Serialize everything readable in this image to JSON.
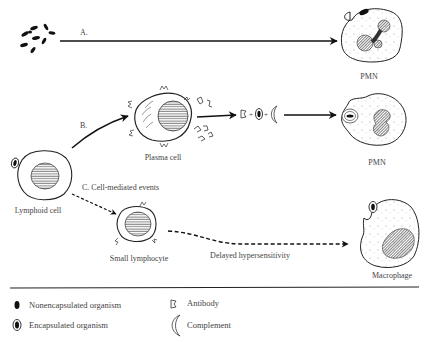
{
  "diagram": {
    "pathway_a": {
      "label": "A.",
      "target": "PMN"
    },
    "pathway_b": {
      "label": "B.",
      "intermediate": "Plasma cell",
      "equation_icons": [
        "antibody-icon",
        "encapsulated-organism-icon",
        "complement-icon"
      ],
      "target": "PMN"
    },
    "pathway_c": {
      "label": "C.  Cell-mediated events",
      "intermediate": "Small lymphocyte",
      "arrow_label": "Delayed hypersensitivity",
      "target": "Macrophage"
    },
    "source": "Lymphoid cell"
  },
  "legend": {
    "items": [
      {
        "icon": "nonencapsulated-organism-icon",
        "label": "Nonencapsulated organism"
      },
      {
        "icon": "encapsulated-organism-icon",
        "label": "Encapsulated organism"
      },
      {
        "icon": "antibody-icon",
        "label": "Antibody"
      },
      {
        "icon": "complement-icon",
        "label": "Complement"
      }
    ]
  },
  "colors": {
    "ink": "#1a1a1a",
    "text": "#444444",
    "background": "#ffffff"
  }
}
